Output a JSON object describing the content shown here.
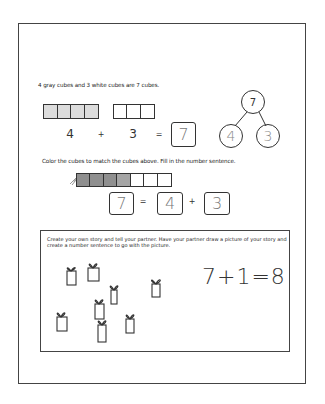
{
  "worksheet": {
    "part1": {
      "sentence": "4 gray cubes and 3 white cubes are 7 cubes.",
      "gray_cubes": 4,
      "white_cubes": 3,
      "equation": {
        "a": "4",
        "plus": "+",
        "b": "3",
        "equals": "=",
        "answer": "7"
      },
      "number_bond": {
        "whole": "7",
        "part_left": "4",
        "part_right": "3"
      }
    },
    "part2": {
      "instruction": "Color the cubes to match the cubes above.  Fill in the number sentence.",
      "total_cubes": 7,
      "shaded_cubes": 4,
      "equation": {
        "total": "7",
        "equals": "=",
        "a": "4",
        "plus": "+",
        "b": "3"
      }
    },
    "part3": {
      "prompt": "Create your own story and tell your partner. Have your partner draw a picture of your story and create a number sentence to go with the picture.",
      "drawing": "presents-drawing",
      "present_count": 8,
      "handwritten_equation": "7+1=8"
    }
  }
}
